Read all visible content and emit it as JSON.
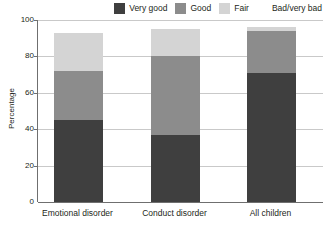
{
  "chart_data": {
    "type": "bar",
    "subtype": "stacked-bar-100",
    "title": "",
    "xlabel": "",
    "ylabel": "Percentage",
    "ylim": [
      0,
      100
    ],
    "yticks": [
      0,
      20,
      40,
      60,
      80,
      100
    ],
    "grid": true,
    "legend_position": "top-right",
    "categories": [
      "Emotional disorder",
      "Conduct disorder",
      "All children"
    ],
    "series": [
      {
        "name": "Very good",
        "color": "#3f3f3f",
        "values": [
          45,
          37,
          71
        ]
      },
      {
        "name": "Good",
        "color": "#8c8c8c",
        "values": [
          27,
          43,
          23
        ]
      },
      {
        "name": "Fair",
        "color": "#d4d4d4",
        "values": [
          21,
          15,
          2
        ]
      },
      {
        "name": "Bad/very bad",
        "color": "#ffffff",
        "values": [
          7,
          5,
          4
        ]
      }
    ],
    "cumulative_tops": [
      {
        "category": "Emotional disorder",
        "very_good": 45,
        "good_top": 72,
        "fair_top": 93
      },
      {
        "category": "Conduct disorder",
        "very_good": 37,
        "good_top": 80,
        "fair_top": 95
      },
      {
        "category": "All children",
        "very_good": 71,
        "good_top": 94,
        "fair_top": 96
      }
    ]
  },
  "legend": {
    "items": [
      {
        "label": "Very good",
        "color": "#3f3f3f"
      },
      {
        "label": "Good",
        "color": "#8c8c8c"
      },
      {
        "label": "Fair",
        "color": "#d4d4d4"
      },
      {
        "label": "Bad/very bad",
        "color": "#ffffff"
      }
    ]
  },
  "axes": {
    "y_title": "Percentage",
    "y_ticks": [
      "100",
      "80",
      "60",
      "40",
      "20",
      "0"
    ],
    "x_ticks": [
      "Emotional disorder",
      "Conduct disorder",
      "All children"
    ]
  },
  "colors": {
    "axis": "#6f6f6f",
    "grid": "#c9c9c9",
    "text": "#231f20",
    "background": "#ffffff"
  }
}
